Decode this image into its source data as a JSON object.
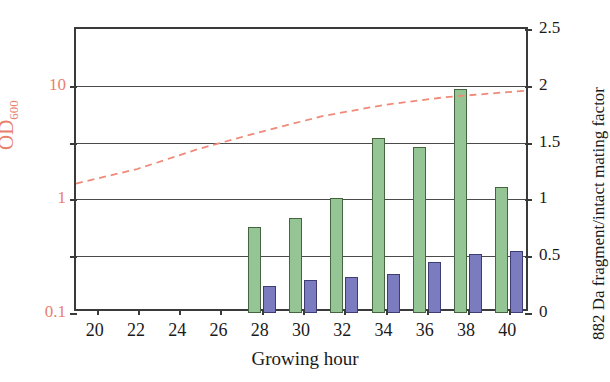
{
  "chart_data": {
    "type": "bar",
    "title": "",
    "xlabel": "Growing hour",
    "x_ticks": [
      20,
      22,
      24,
      26,
      28,
      30,
      32,
      34,
      36,
      38,
      40
    ],
    "xlim": [
      19,
      41
    ],
    "grid": true,
    "legend": "none",
    "axes": {
      "left": {
        "label_text": "OD",
        "label_sub": "600",
        "scale": "log",
        "color": "#e8806e",
        "ticks": [
          "0.1",
          "1",
          "10"
        ],
        "tick_values": [
          0.1,
          1,
          10
        ],
        "minor_gridline_values": [
          0.316,
          3.16
        ],
        "ylim": [
          0.1,
          31.6
        ]
      },
      "right": {
        "label": "882 Da fragment/intact mating factor",
        "scale": "linear",
        "color": "#1a1a1a",
        "ticks": [
          "0",
          "0.5",
          "1",
          "1.5",
          "2",
          "2.5"
        ],
        "tick_values": [
          0,
          0.5,
          1,
          1.5,
          2,
          2.5
        ],
        "ylim": [
          0,
          2.5
        ]
      }
    },
    "categories": [
      28,
      30,
      32,
      34,
      36,
      38,
      40
    ],
    "series": [
      {
        "name": "OD600",
        "axis": "left",
        "color": "#96c595",
        "values": [
          0.57,
          0.69,
          1.02,
          3.5,
          2.9,
          9.4,
          1.28
        ]
      },
      {
        "name": "882 Da fragment/intact mating factor",
        "axis": "right",
        "color": "#7b7cc0",
        "values": [
          0.24,
          0.29,
          0.32,
          0.34,
          0.45,
          0.52,
          0.55
        ]
      }
    ],
    "annotations": [
      {
        "name": "dashed-trend-line",
        "style": "dashed",
        "color": "#ef8a78",
        "axis": "right",
        "points": [
          {
            "x": 19.0,
            "y": 1.12
          },
          {
            "x": 22.0,
            "y": 1.25
          },
          {
            "x": 25.0,
            "y": 1.43
          },
          {
            "x": 28.0,
            "y": 1.58
          },
          {
            "x": 31.0,
            "y": 1.72
          },
          {
            "x": 34.0,
            "y": 1.82
          },
          {
            "x": 37.0,
            "y": 1.89
          },
          {
            "x": 41.0,
            "y": 1.95
          }
        ]
      }
    ]
  },
  "figure": {
    "background": "#ffffff",
    "frame_color": "#3a3a3a"
  }
}
